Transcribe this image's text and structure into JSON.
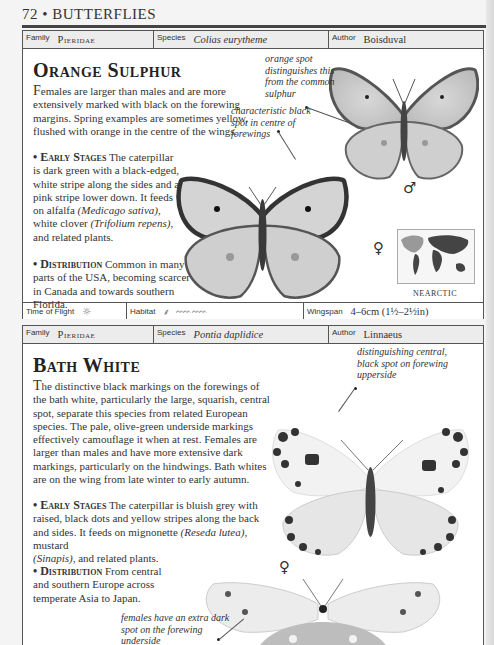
{
  "page": {
    "number": "72",
    "bullet": "•",
    "section": "BUTTERFLIES"
  },
  "entries": [
    {
      "family_label": "Family",
      "family": "Pieridae",
      "species_label": "Species",
      "species": "Colias eurytheme",
      "author_label": "Author",
      "author": "Boisduval",
      "title": "Orange Sulphur",
      "intro_drop": "F",
      "intro": "emales are larger than males and are more extensively marked with black on the forewing margins. Spring examples are sometimes yellow, flushed with orange in the centre of the wings.",
      "early_stages_heading": "• Early Stages",
      "early_stages_a": " The caterpillar is dark green with a black-edged, white stripe along the sides and a pink stripe lower down. It feeds on alfalfa ",
      "early_stages_it1": "(Medicago sativa)",
      "early_stages_b": ", white clover ",
      "early_stages_it2": "(Trifolium repens)",
      "early_stages_c": ", and related plants.",
      "distribution_heading": "• Distribution",
      "distribution": " Common in many parts of the USA, becoming scarcer in Canada and towards southern Florida.",
      "annotations": [
        "orange spot distinguishes this from the common sulphur",
        "characteristic black spot in centre of forewings"
      ],
      "male_symbol": "♂",
      "female_symbol": "♀",
      "map_label": "NEARCTIC",
      "time_of_flight_label": "Time of Flight",
      "time_of_flight_icon": "sun-icon",
      "habitat_label": "Habitat",
      "habitat_icons": [
        "grass-icon",
        "meadow-icon"
      ],
      "wingspan_label": "Wingspan",
      "wingspan": "4–6cm (1½–2½in)"
    },
    {
      "family_label": "Family",
      "family": "Pieridae",
      "species_label": "Species",
      "species": "Pontia daplidice",
      "author_label": "Author",
      "author": "Linnaeus",
      "title": "Bath White",
      "intro_drop": "T",
      "intro": "he distinctive black markings on the forewings of the bath white, particularly the large, squarish, central spot, separate this species from related European species. The pale, olive-green underside markings effectively camouflage it when at rest. Females are larger than males and have more extensive dark markings, particularly on the hindwings. Bath whites are on the wing from late winter to early autumn.",
      "early_stages_heading": "• Early Stages",
      "early_stages_a": " The caterpillar is bluish grey with raised, black dots and yellow stripes along the back and sides. It feeds on mignonette ",
      "early_stages_it1": "(Reseda lutea)",
      "early_stages_b": ", mustard ",
      "early_stages_it2": "(Sinapis)",
      "early_stages_c": ", and related plants.",
      "distribution_heading": "• Distribution",
      "distribution": " From central and southern Europe across temperate Asia to Japan.",
      "annotations": [
        "distinguishing central, black spot on forewing upperside",
        "females have an extra dark spot on the forewing underside"
      ],
      "female_symbol": "♀"
    }
  ]
}
